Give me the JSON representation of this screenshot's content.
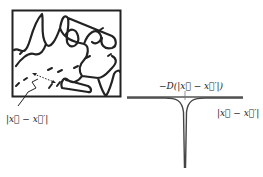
{
  "left_panel": {
    "description": "Random polymer chain configuration in a box with dashed short segments",
    "separation_label": "|x⃗ − x⃗′|"
  },
  "right_panel": {
    "curve_label": "−D(|x⃗ − x⃗′|)",
    "axis_label": "|x⃗ − x⃗′|",
    "curve_shape": "sharp negative spike at origin, flat elsewhere"
  },
  "colors": {
    "ink": "#222222",
    "curve": "#555555"
  }
}
